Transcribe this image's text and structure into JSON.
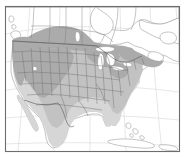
{
  "figure": {
    "kind": "species-range-map",
    "region": "North America",
    "title": "",
    "frame": {
      "visible": true,
      "stroke_color": "#6d6d6d",
      "x": 5.5,
      "y": 6.5,
      "width": 174,
      "height": 145
    },
    "background_color": "#ffffff"
  },
  "legend": {
    "visible": false,
    "entries": [
      {
        "label": "Core range",
        "color": "#ababab"
      },
      {
        "label": "Range",
        "color": "#c2c2c2"
      },
      {
        "label": "Peripheral range",
        "color": "#d6d6d6"
      }
    ]
  },
  "map_layers": {
    "graticule": {
      "visible": true,
      "color": "#c9c9c9",
      "meridian_count": 6,
      "parallel_count": 5
    },
    "coastline": {
      "visible": true,
      "color": "#8a8a8a"
    },
    "lakes": {
      "visible": true,
      "color": "#ffffff",
      "names": [
        "Superior",
        "Michigan",
        "Huron",
        "Erie",
        "Ontario",
        "Great Salt Lake",
        "Winnipeg"
      ]
    },
    "state_boundaries": {
      "visible": true,
      "color": "#6f6f6f"
    },
    "province_boundaries": {
      "visible": true,
      "color": "#7e7e7e"
    },
    "national_boundaries": {
      "visible": true,
      "color": "#5c5c5c"
    }
  },
  "range_shading": {
    "dark": {
      "color": "#ababab",
      "label": "Core range",
      "areas": [
        "Pacific Northwest",
        "Great Basin",
        "Rocky Mountains",
        "Northern Plains",
        "Alberta",
        "Saskatchewan",
        "Upper Midwest",
        "New England",
        "Maritimes"
      ]
    },
    "mid": {
      "color": "#c2c2c2",
      "label": "Range",
      "areas": [
        "California",
        "Southwest",
        "Central Plains",
        "Ohio Valley",
        "Mid-Atlantic"
      ]
    },
    "light": {
      "color": "#d6d6d6",
      "label": "Peripheral range",
      "areas": [
        "Texas",
        "Southeast",
        "Gulf Coast",
        "Northern Mexico",
        "Baja California"
      ]
    }
  },
  "landmasses": [
    "United States",
    "Canada",
    "Mexico",
    "Cuba",
    "Bahamas",
    "Vancouver Island",
    "Newfoundland",
    "Nova Scotia",
    "Baja California",
    "Florida"
  ],
  "water_bodies": [
    "Pacific Ocean",
    "Atlantic Ocean",
    "Gulf of Mexico",
    "Gulf of California",
    "Gulf of St. Lawrence",
    "Hudson Bay",
    "Great Lakes",
    "Caribbean Sea"
  ]
}
